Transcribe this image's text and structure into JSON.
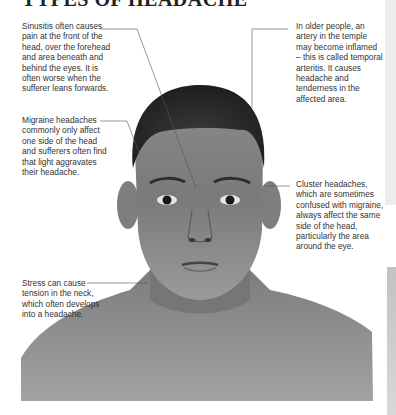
{
  "page": {
    "title": "TYPES OF HEADACHE"
  },
  "figure": {
    "image_description": "Photograph of a man's head and shoulders, front view, in grayscale"
  },
  "captions": {
    "sinusitis": "Sinusitis often causes pain at the front of the head, over the forehead and area beneath and behind the eyes. It is often worse when the sufferer leans forwards.",
    "temporal_arteritis": "In older people, an artery in the temple may become inflamed – this is called temporal arteritis. It causes headache and tenderness in the affected area.",
    "migraine": "Migraine headaches commonly only affect one side of the head and sufferers often find that light aggravates their headache.",
    "cluster": "Cluster headaches, which are sometimes confused with migraine, always affect the same side of the head, particularly the area around the eye.",
    "stress": "Stress can cause tension in the neck, which often develops into a headache."
  }
}
